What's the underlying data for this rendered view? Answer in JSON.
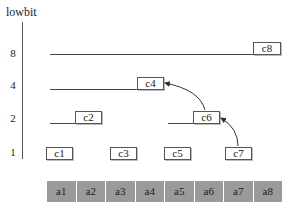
{
  "title": "lowbit",
  "y_axis": {
    "labels": [
      {
        "text": "8",
        "y": 48
      },
      {
        "text": "4",
        "y": 80
      },
      {
        "text": "2",
        "y": 113
      },
      {
        "text": "1",
        "y": 147
      }
    ]
  },
  "c_nodes": [
    {
      "label": "c1",
      "lowbit": 1,
      "x": 46,
      "y": 147,
      "w": 25,
      "line_from": null
    },
    {
      "label": "c2",
      "lowbit": 2,
      "x": 75,
      "y": 111,
      "w": 25,
      "line_from": 50
    },
    {
      "label": "c3",
      "lowbit": 1,
      "x": 110,
      "y": 147,
      "w": 25,
      "line_from": null
    },
    {
      "label": "c4",
      "lowbit": 4,
      "x": 137,
      "y": 77,
      "w": 25,
      "line_from": 50
    },
    {
      "label": "c5",
      "lowbit": 1,
      "x": 164,
      "y": 147,
      "w": 25,
      "line_from": null
    },
    {
      "label": "c6",
      "lowbit": 2,
      "x": 193,
      "y": 111,
      "w": 25,
      "line_from": 168
    },
    {
      "label": "c7",
      "lowbit": 1,
      "x": 225,
      "y": 147,
      "w": 25,
      "line_from": null
    },
    {
      "label": "c8",
      "lowbit": 8,
      "x": 253,
      "y": 42,
      "w": 26,
      "line_from": 50
    }
  ],
  "arrows": [
    {
      "from": "c7",
      "to": "c6"
    },
    {
      "from": "c6",
      "to": "c4"
    }
  ],
  "a_cells": [
    "a1",
    "a2",
    "a3",
    "a4",
    "a5",
    "a6",
    "a7",
    "a8"
  ],
  "colors": {
    "cell_fill": "#9a9a9a",
    "line": "#444444"
  }
}
